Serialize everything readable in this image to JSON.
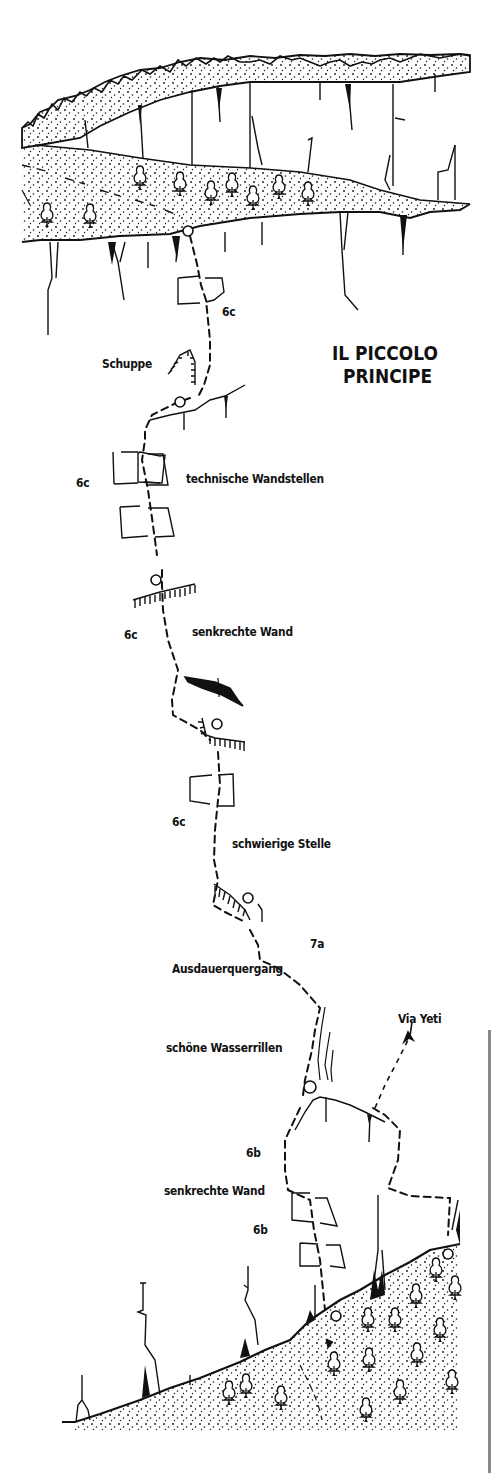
{
  "title": {
    "line1": "IL PICCOLO",
    "line2": "PRINCIPE"
  },
  "colors": {
    "ink": "#111111",
    "background": "#ffffff",
    "edge": "#888888"
  },
  "labels": {
    "grade_p1": "6c",
    "schuppe": "Schuppe",
    "grade_p2": "6c",
    "technische": "technische Wandstellen",
    "grade_p3": "6c",
    "senkrechte_1": "senkrechte Wand",
    "grade_p4": "6c",
    "schwierige": "schwierige Stelle",
    "grade_p5": "7a",
    "ausdauer": "Ausdauerquergang",
    "wasserrillen": "schöne Wasserrillen",
    "via_yeti": "Via Yeti",
    "grade_p6": "6b",
    "senkrechte_2": "senkrechte Wand",
    "grade_p7": "6b"
  },
  "legend_icons": {
    "belay": "belay-station-circle-icon",
    "tree": "tree-icon",
    "roof": "roof-overhang-icon",
    "flake": "flake-icon",
    "dihedral": "dihedral-box-icon",
    "arrow": "route-arrow-icon"
  }
}
